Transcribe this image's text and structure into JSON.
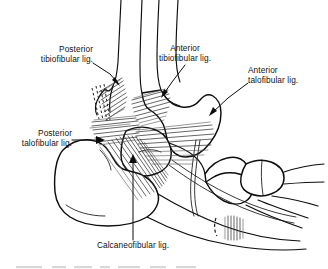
{
  "figure": {
    "view": "lateral",
    "background_color": "#ffffff",
    "line_color": "#0d0d0d",
    "fiber_color": "#2b2b2b"
  },
  "labels": [
    {
      "id": "posterior-tibiofibular",
      "line1": "Posterior",
      "line2": "tibiofibular lig.",
      "align": "right"
    },
    {
      "id": "anterior-tibiofibular",
      "line1": "Anterior",
      "line2": "tibiofibular lig.",
      "align": "center"
    },
    {
      "id": "anterior-talofibular",
      "line1": "Anterior",
      "line2": "talofibular lig.",
      "align": "left"
    },
    {
      "id": "posterior-talofibular",
      "line1": "Posterior",
      "line2": "talofibular lig.",
      "align": "right"
    },
    {
      "id": "calcaneofibular",
      "line1": "Calcaneofibular lig.",
      "line2": "",
      "align": "center"
    }
  ],
  "bottom_caption": {
    "text": ""
  }
}
